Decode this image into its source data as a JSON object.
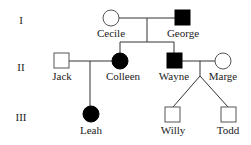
{
  "generations": [
    {
      "label": "I"
    },
    {
      "label": "II"
    },
    {
      "label": "III"
    }
  ],
  "individuals": {
    "cecile": {
      "name": "Cecile",
      "sex": "female",
      "affected": false,
      "generation": "I"
    },
    "george": {
      "name": "George",
      "sex": "male",
      "affected": true,
      "generation": "I"
    },
    "jack": {
      "name": "Jack",
      "sex": "male",
      "affected": false,
      "generation": "II"
    },
    "colleen": {
      "name": "Colleen",
      "sex": "female",
      "affected": true,
      "generation": "II"
    },
    "wayne": {
      "name": "Wayne",
      "sex": "male",
      "affected": true,
      "generation": "II"
    },
    "marge": {
      "name": "Marge",
      "sex": "female",
      "affected": false,
      "generation": "II"
    },
    "leah": {
      "name": "Leah",
      "sex": "female",
      "affected": true,
      "generation": "III"
    },
    "willy": {
      "name": "Willy",
      "sex": "male",
      "affected": false,
      "generation": "III"
    },
    "todd": {
      "name": "Todd",
      "sex": "male",
      "affected": false,
      "generation": "III"
    }
  },
  "relationships": [
    {
      "type": "mating",
      "partners": [
        "Cecile",
        "George"
      ],
      "children": [
        "Colleen",
        "Wayne"
      ]
    },
    {
      "type": "mating",
      "partners": [
        "Jack",
        "Colleen"
      ],
      "children": [
        "Leah"
      ]
    },
    {
      "type": "mating",
      "partners": [
        "Wayne",
        "Marge"
      ],
      "children": [
        "Willy",
        "Todd"
      ],
      "twins": true
    }
  ],
  "colors": {
    "affected": "#000000",
    "unaffected": "#ffffff",
    "line": "#333333"
  }
}
